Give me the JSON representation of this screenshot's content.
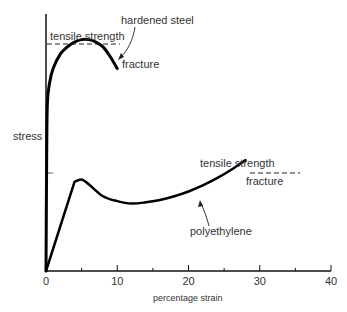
{
  "chart_data": {
    "type": "line",
    "title": "",
    "xlabel": "percentage strain",
    "ylabel": "stress",
    "xlim": [
      0,
      40
    ],
    "ylim": [
      0,
      100
    ],
    "x_ticks": [
      0,
      10,
      20,
      30,
      40
    ],
    "x_minor_ticks": [
      5,
      15,
      25,
      35
    ],
    "grid": false,
    "legend": "none",
    "series": [
      {
        "name": "hardened steel",
        "x": [
          0,
          0.1,
          0.2,
          0.5,
          1,
          2,
          3,
          4,
          5,
          6,
          7,
          8,
          9,
          10
        ],
        "y": [
          0,
          50,
          70,
          78,
          84,
          90,
          93,
          95,
          96,
          96,
          95,
          93,
          89,
          84
        ]
      },
      {
        "name": "polyethylene",
        "x": [
          0,
          4,
          5,
          6,
          8,
          10,
          12,
          14,
          16,
          18,
          20,
          22,
          24,
          26,
          28
        ],
        "y": [
          0,
          37,
          38,
          36,
          31,
          29,
          28,
          28.5,
          29.5,
          31,
          33,
          35.5,
          38.5,
          42,
          46
        ]
      }
    ],
    "annotations": [
      {
        "text": "hardened steel",
        "points_to": "hardened steel curve near fracture"
      },
      {
        "text": "tensile strength",
        "series": "hardened steel",
        "value": 96
      },
      {
        "text": "fracture",
        "series": "hardened steel",
        "x": 10
      },
      {
        "text": "tensile strength",
        "series": "polyethylene",
        "value": 46
      },
      {
        "text": "fracture",
        "series": "polyethylene",
        "x": 28
      },
      {
        "text": "polyethylene",
        "points_to": "polyethylene curve"
      }
    ]
  },
  "labels": {
    "hardened_steel": "hardened steel",
    "tensile_strength_1": "tensile strength",
    "fracture_1": "fracture",
    "tensile_strength_2": "tensile strength",
    "fracture_2": "fracture",
    "polyethylene": "polyethylene",
    "stress": "stress",
    "xlabel": "percentage strain",
    "ticks": [
      "0",
      "10",
      "20",
      "30",
      "40"
    ]
  }
}
